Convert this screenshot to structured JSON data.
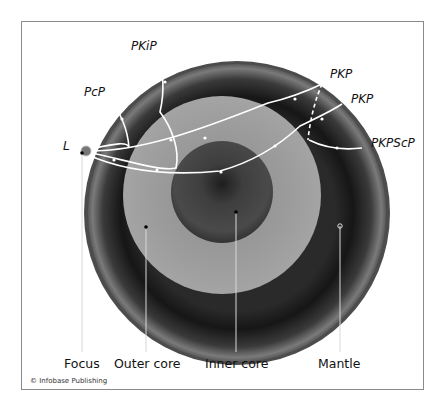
{
  "diagram": {
    "phase_labels": {
      "pkip": "PKiP",
      "pcp": "PcP",
      "pkp1": "PKP",
      "pkp2": "PKP",
      "pkpscp": "PKPScP",
      "l": "L"
    },
    "part_labels": {
      "focus": "Focus",
      "outer_core": "Outer core",
      "inner_core": "Inner core",
      "mantle": "Mantle"
    },
    "credit": "© Infobase Publishing",
    "colors": {
      "mantle_dark": "#1e1e1e",
      "mantle_light": "#6a6a6a",
      "crust": "#4a4a4a",
      "outer_core": "#9a9a9a",
      "inner_core": "#404040",
      "ray": "#ffffff",
      "frame": "#8a8a8a"
    }
  }
}
